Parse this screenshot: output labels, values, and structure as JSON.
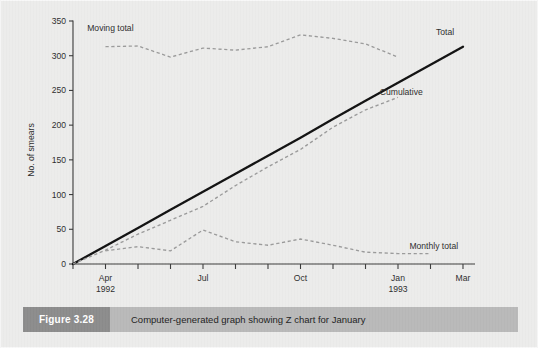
{
  "figure": {
    "number_label": "Figure 3.28",
    "caption": "Computer-generated graph showing Z chart for January"
  },
  "colors": {
    "page_background": "#ececeb",
    "caption_band": "#b9b9b9",
    "caption_tag": "#8c8c8c",
    "total_line": "#111111",
    "dashed_series": "#9a9a9a",
    "axis": "#3b3b3b"
  },
  "chart_data": {
    "type": "line",
    "title": "",
    "xlabel": "",
    "ylabel": "No. of smears",
    "ylim": [
      0,
      350
    ],
    "yticks": [
      0,
      50,
      100,
      150,
      200,
      250,
      300,
      350
    ],
    "grid": false,
    "legend_position": "inline-annotations",
    "x_tick_count": 13,
    "x_tick_labels": [
      {
        "index": 1,
        "label": "Apr",
        "sublabel": "1992"
      },
      {
        "index": 4,
        "label": "Jul",
        "sublabel": ""
      },
      {
        "index": 7,
        "label": "Oct",
        "sublabel": ""
      },
      {
        "index": 10,
        "label": "Jan",
        "sublabel": "1993"
      },
      {
        "index": 12,
        "label": "Mar",
        "sublabel": ""
      }
    ],
    "x": [
      "Mar",
      "Apr",
      "May",
      "Jun",
      "Jul",
      "Aug",
      "Sep",
      "Oct",
      "Nov",
      "Dec",
      "Jan",
      "Feb",
      "Mar"
    ],
    "series": [
      {
        "name": "Total",
        "style": "solid",
        "annotation": "Total",
        "values": [
          0,
          26,
          52,
          78,
          104,
          130,
          156,
          182,
          209,
          235,
          261,
          287,
          313
        ]
      },
      {
        "name": "Cumulative",
        "style": "dashed",
        "annotation": "Cumulative",
        "values": [
          0,
          20,
          43,
          63,
          83,
          113,
          140,
          165,
          197,
          222,
          240,
          null,
          null
        ]
      },
      {
        "name": "Moving total",
        "style": "dashed",
        "annotation": "Moving total",
        "values": [
          null,
          313,
          314,
          298,
          311,
          308,
          313,
          330,
          325,
          317,
          298,
          null,
          null
        ]
      },
      {
        "name": "Monthly total",
        "style": "dashed",
        "annotation": "Monthly total",
        "values": [
          null,
          19,
          25,
          19,
          49,
          32,
          27,
          36,
          27,
          17,
          15,
          15,
          null
        ]
      }
    ],
    "annotations": [
      {
        "text": "Moving total",
        "x_value": 1.15,
        "y_value": 336
      },
      {
        "text": "Total",
        "x_value": 11.45,
        "y_value": 330
      },
      {
        "text": "Cumulative",
        "x_value": 10.1,
        "y_value": 243
      },
      {
        "text": "Monthly total",
        "x_value": 11.1,
        "y_value": 22
      }
    ]
  }
}
